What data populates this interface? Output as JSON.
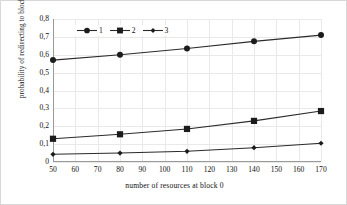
{
  "chart_data": {
    "type": "line",
    "title": "",
    "xlabel": "number of resources at block 0",
    "ylabel": "probability of redirecting to block 0",
    "x": [
      50,
      80,
      110,
      140,
      170
    ],
    "xlim": [
      50,
      170
    ],
    "ylim": [
      0,
      0.8
    ],
    "xticks": [
      "50",
      "60",
      "70",
      "80",
      "90",
      "100",
      "110",
      "120",
      "130",
      "140",
      "150",
      "160",
      "170"
    ],
    "xtick_values": [
      50,
      60,
      70,
      80,
      90,
      100,
      110,
      120,
      130,
      140,
      150,
      160,
      170
    ],
    "yticks": [
      "0",
      "0,1",
      "0,2",
      "0,3",
      "0,4",
      "0,5",
      "0,6",
      "0,7",
      "0,8"
    ],
    "ytick_values": [
      0,
      0.1,
      0.2,
      0.3,
      0.4,
      0.5,
      0.6,
      0.7,
      0.8
    ],
    "grid": true,
    "legend_position": "top-left-inside",
    "series": [
      {
        "name": "1",
        "marker": "circle",
        "color": "#1c1c1c",
        "values": [
          0.57,
          0.6,
          0.635,
          0.675,
          0.71
        ]
      },
      {
        "name": "2",
        "marker": "square",
        "color": "#1c1c1c",
        "values": [
          0.13,
          0.155,
          0.185,
          0.23,
          0.285
        ]
      },
      {
        "name": "3",
        "marker": "diamond",
        "color": "#1c1c1c",
        "values": [
          0.043,
          0.05,
          0.06,
          0.08,
          0.105
        ]
      }
    ]
  },
  "legend": {
    "items": [
      {
        "label": "1",
        "marker": "circle"
      },
      {
        "label": "2",
        "marker": "square"
      },
      {
        "label": "3",
        "marker": "diamond"
      }
    ]
  }
}
